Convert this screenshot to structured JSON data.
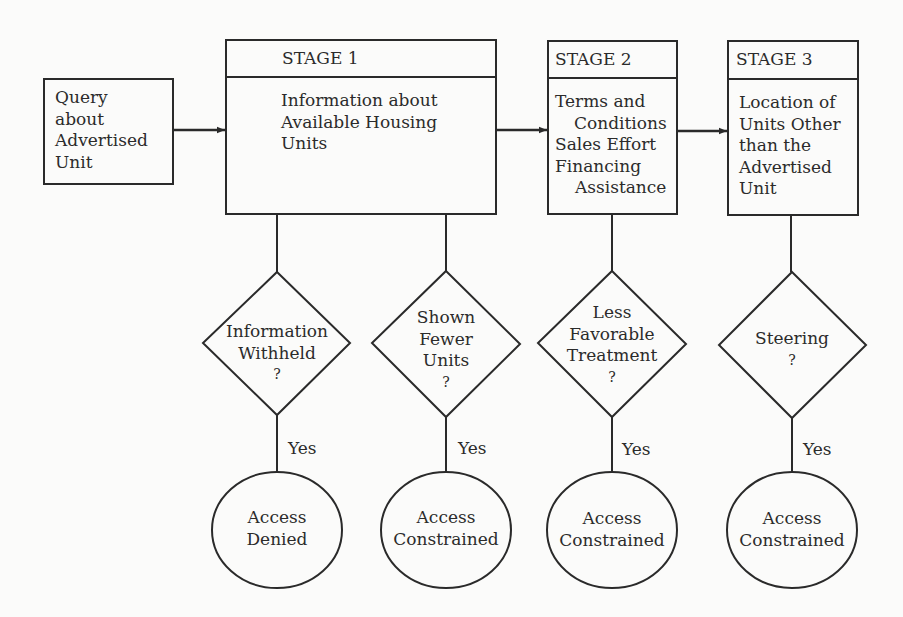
{
  "start": {
    "lines": [
      "Query",
      "about",
      "Advertised",
      "Unit"
    ]
  },
  "stages": [
    {
      "title": "STAGE 1",
      "body": [
        "Information about",
        "Available Housing",
        "Units"
      ]
    },
    {
      "title": "STAGE 2",
      "body": [
        "Terms and",
        "Conditions",
        "Sales Effort",
        "Financing",
        "Assistance"
      ]
    },
    {
      "title": "STAGE 3",
      "body": [
        "Location of",
        "Units Other",
        "than the",
        "Advertised",
        "Unit"
      ]
    }
  ],
  "decisions": [
    {
      "lines": [
        "Information",
        "Withheld",
        "?"
      ],
      "edge_label": "Yes",
      "outcome": [
        "Access",
        "Denied"
      ]
    },
    {
      "lines": [
        "Shown",
        "Fewer",
        "Units",
        "?"
      ],
      "edge_label": "Yes",
      "outcome": [
        "Access",
        "Constrained"
      ]
    },
    {
      "lines": [
        "Less",
        "Favorable",
        "Treatment",
        "?"
      ],
      "edge_label": "Yes",
      "outcome": [
        "Access",
        "Constrained"
      ]
    },
    {
      "lines": [
        "Steering",
        "?"
      ],
      "edge_label": "Yes",
      "outcome": [
        "Access",
        "Constrained"
      ]
    }
  ],
  "colors": {
    "stroke": "#2a2a2a",
    "background": "#fbfbfa"
  }
}
